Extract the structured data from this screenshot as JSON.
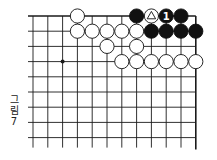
{
  "figure": {
    "caption_chars": [
      "그",
      "림",
      "7"
    ],
    "caption": "그림 7"
  },
  "board": {
    "columns": 12,
    "rows": 9,
    "origin_x": 33,
    "origin_y": 16,
    "spacing_x": 14.8,
    "spacing_y": 15.2,
    "top_edge": true,
    "right_edge": true,
    "line_color": "#1a1a1a",
    "star_points": [
      {
        "col": 2,
        "row": 3
      }
    ],
    "stones": [
      {
        "col": 3,
        "row": 0,
        "color": "white"
      },
      {
        "col": 7,
        "row": 0,
        "color": "black"
      },
      {
        "col": 8,
        "row": 0,
        "color": "white",
        "mark": "triangle"
      },
      {
        "col": 9,
        "row": 0,
        "color": "black",
        "label": "1"
      },
      {
        "col": 10,
        "row": 0,
        "color": "black"
      },
      {
        "col": 3,
        "row": 1,
        "color": "white"
      },
      {
        "col": 4,
        "row": 1,
        "color": "white"
      },
      {
        "col": 5,
        "row": 1,
        "color": "white"
      },
      {
        "col": 6,
        "row": 1,
        "color": "white"
      },
      {
        "col": 7,
        "row": 1,
        "color": "white"
      },
      {
        "col": 8,
        "row": 1,
        "color": "black"
      },
      {
        "col": 9,
        "row": 1,
        "color": "black"
      },
      {
        "col": 10,
        "row": 1,
        "color": "black"
      },
      {
        "col": 11,
        "row": 1,
        "color": "black"
      },
      {
        "col": 5,
        "row": 2,
        "color": "white"
      },
      {
        "col": 7,
        "row": 2,
        "color": "white"
      },
      {
        "col": 6,
        "row": 3,
        "color": "white"
      },
      {
        "col": 7,
        "row": 3,
        "color": "white"
      },
      {
        "col": 8,
        "row": 3,
        "color": "white"
      },
      {
        "col": 9,
        "row": 3,
        "color": "white"
      },
      {
        "col": 10,
        "row": 3,
        "color": "white"
      },
      {
        "col": 11,
        "row": 3,
        "color": "white"
      }
    ]
  }
}
